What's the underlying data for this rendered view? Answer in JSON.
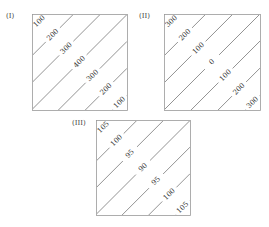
{
  "figure": {
    "panels": [
      {
        "label": "(I)",
        "box": {
          "x": 32,
          "y": 14,
          "w": 95,
          "h": 96
        },
        "contours": [
          "100",
          "200",
          "300",
          "400",
          "300",
          "200",
          "100"
        ]
      },
      {
        "label": "(II)",
        "box": {
          "x": 164,
          "y": 14,
          "w": 96,
          "h": 96
        },
        "contours": [
          "300",
          "200",
          "100",
          "0",
          "100",
          "200",
          "300"
        ]
      },
      {
        "label": "(III)",
        "box": {
          "x": 96,
          "y": 120,
          "w": 94,
          "h": 95
        },
        "contours": [
          "105",
          "100",
          "95",
          "90",
          "95",
          "100",
          "105"
        ]
      }
    ],
    "colors": {
      "line": "#777777",
      "border": "#999999",
      "text": "#333333"
    }
  }
}
